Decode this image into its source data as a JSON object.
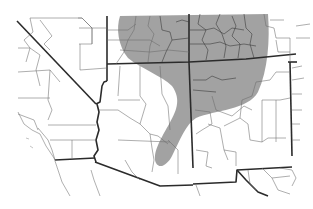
{
  "map": {
    "title": "",
    "region": "Southwestern United States",
    "states_shown": [
      "California",
      "Nevada",
      "Utah",
      "Arizona",
      "Colorado",
      "New Mexico"
    ],
    "shading": {
      "description": "Distribution range (shaded gray)",
      "color": "#9a9a9a",
      "covers": [
        "eastern Utah",
        "western and central Colorado",
        "northeastern Arizona",
        "northwestern New Mexico"
      ],
      "tail": "extends southwest into central Arizona"
    },
    "boundary_colors": {
      "state": "#2b2b2b",
      "county": "#6a6a6a"
    },
    "background": "#ffffff"
  }
}
